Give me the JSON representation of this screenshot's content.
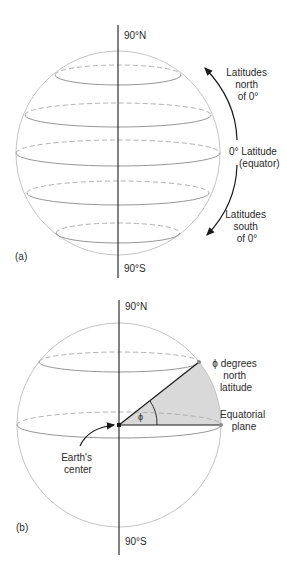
{
  "figure_a": {
    "panel_label": "(a)",
    "north_pole_label": "90°N",
    "south_pole_label": "90°S",
    "north_arrow_label": [
      "Latitudes",
      "north",
      "of 0°"
    ],
    "equator_label": [
      "0° Latitude",
      "(equator)"
    ],
    "south_arrow_label": [
      "Latitudes",
      "south",
      "of 0°"
    ]
  },
  "figure_b": {
    "panel_label": "(b)",
    "north_pole_label": "90°N",
    "south_pole_label": "90°S",
    "point_label": [
      "ϕ degrees",
      "north",
      "latitude"
    ],
    "plane_label": [
      "Equatorial",
      "plane"
    ],
    "center_label": [
      "Earth's",
      "center"
    ],
    "angle_symbol": "ϕ"
  },
  "colors": {
    "wedge_fill": "#d9d9d9",
    "sphere_outline": "#bdbdbd",
    "axis": "#1a1a1a"
  }
}
